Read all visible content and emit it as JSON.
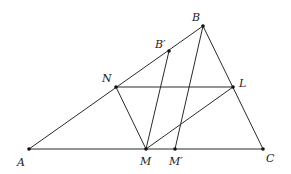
{
  "diagram": {
    "type": "geometry-triangle",
    "colors": {
      "line": "#2a2a2a",
      "point": "#111111",
      "label": "#222222",
      "background": "#ffffff"
    },
    "points": {
      "A": {
        "x": 29,
        "y": 149,
        "label": "A",
        "lx": 17,
        "ly": 166
      },
      "B": {
        "x": 203,
        "y": 26,
        "label": "B",
        "lx": 192,
        "ly": 21
      },
      "C": {
        "x": 263,
        "y": 149,
        "label": "C",
        "lx": 266,
        "ly": 162
      },
      "N": {
        "x": 116,
        "y": 87,
        "label": "N",
        "lx": 102,
        "ly": 82
      },
      "L": {
        "x": 233,
        "y": 87,
        "label": "L",
        "lx": 239,
        "ly": 87
      },
      "M": {
        "x": 146,
        "y": 149,
        "label": "M",
        "lx": 140,
        "ly": 165
      },
      "M_prime": {
        "x": 175,
        "y": 149,
        "label": "M′",
        "lx": 169,
        "ly": 165
      },
      "B_prime": {
        "x": 169,
        "y": 51,
        "label": "B′",
        "lx": 155,
        "ly": 48
      }
    },
    "segments": [
      [
        "A",
        "B"
      ],
      [
        "B",
        "C"
      ],
      [
        "A",
        "C"
      ],
      [
        "N",
        "L"
      ],
      [
        "N",
        "M"
      ],
      [
        "M",
        "L"
      ],
      [
        "M",
        "B_prime"
      ],
      [
        "M_prime",
        "B"
      ]
    ]
  }
}
